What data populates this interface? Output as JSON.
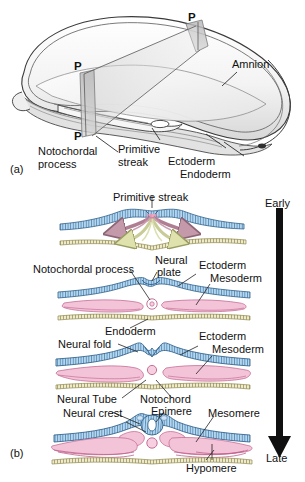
{
  "figure": {
    "panels": [
      {
        "id": "panel-a",
        "label": "(a)",
        "caption": "Whole embryo with cutting plane P–P"
      },
      {
        "id": "panel-b",
        "label": "(b)",
        "caption": "Serial transverse sections, early to late"
      }
    ]
  },
  "panel_a": {
    "id_label": "(a)",
    "plane_letters": [
      "P",
      "P",
      "P"
    ],
    "labels": {
      "amnion": "Amnion",
      "notochordal_process": "Notochordal\nprocess",
      "notochordal_process_line1": "Notochordal",
      "notochordal_process_line2": "process",
      "primitive_streak_line1": "Primitive",
      "primitive_streak_line2": "streak",
      "ectoderm": "Ectoderm",
      "endoderm": "Endoderm"
    }
  },
  "panel_b": {
    "id_label": "(b)",
    "time_axis": {
      "start": "Early",
      "end": "Late",
      "direction": "downward"
    },
    "sections": [
      {
        "name": "section-1-primitive-streak",
        "labels": [
          "Primitive streak"
        ],
        "features": [
          "ectoderm",
          "primitive streak",
          "mesoderm migration arrows",
          "endoderm migration arrows"
        ]
      },
      {
        "name": "section-2-neural-plate",
        "labels": [
          "Notochordal process",
          "Neural plate",
          "Ectoderm",
          "Mesoderm",
          "Endoderm"
        ],
        "neural_plate_line1": "Neural",
        "neural_plate_line2": "plate",
        "features": [
          "neural plate",
          "notochordal process",
          "mesoderm lobes",
          "endoderm"
        ]
      },
      {
        "name": "section-3-neural-fold",
        "labels": [
          "Neural fold",
          "Ectoderm",
          "Mesoderm",
          "Neural Tube",
          "Notochord"
        ],
        "features": [
          "neural folds",
          "notochord",
          "mesoderm",
          "endoderm"
        ]
      },
      {
        "name": "section-4-neural-tube",
        "labels": [
          "Neural crest",
          "Epimere",
          "Mesomere",
          "Hypomere"
        ],
        "features": [
          "closed neural tube",
          "neural crest",
          "notochord",
          "epimere",
          "mesomere",
          "hypomere"
        ]
      }
    ],
    "label_text": {
      "primitive_streak": "Primitive streak",
      "notochordal_process": "Notochordal process",
      "neural_plate_1": "Neural",
      "neural_plate_2": "plate",
      "ectoderm_2": "Ectoderm",
      "mesoderm_2": "Mesoderm",
      "endoderm_2": "Endoderm",
      "ectoderm_3": "Ectoderm",
      "mesoderm_3": "Mesoderm",
      "neural_fold": "Neural fold",
      "neural_tube": "Neural Tube",
      "notochord": "Notochord",
      "neural_crest": "Neural crest",
      "epimere": "Epimere",
      "mesomere": "Mesomere",
      "hypomere": "Hypomere",
      "early": "Early",
      "late": "Late"
    }
  },
  "colors": {
    "ectoderm_fill": "#b6d8ef",
    "ectoderm_stripe": "#4b7fae",
    "ectoderm_line": "#2f5f8a",
    "mesoderm_fill": "#f3c3d8",
    "mesoderm_line": "#c0618c",
    "endoderm_fill": "#eeeacb",
    "endoderm_line": "#8f8a4e",
    "arrow_mesoderm": "#b07e93",
    "arrow_endoderm": "#c9cc96",
    "notochord_fill": "#f6cfe0",
    "drawing_ink": "#3a3a3a",
    "plane_fill": "#c9c9c9",
    "time_arrow": "#101010",
    "text": "#111111",
    "background": "#ffffff"
  }
}
